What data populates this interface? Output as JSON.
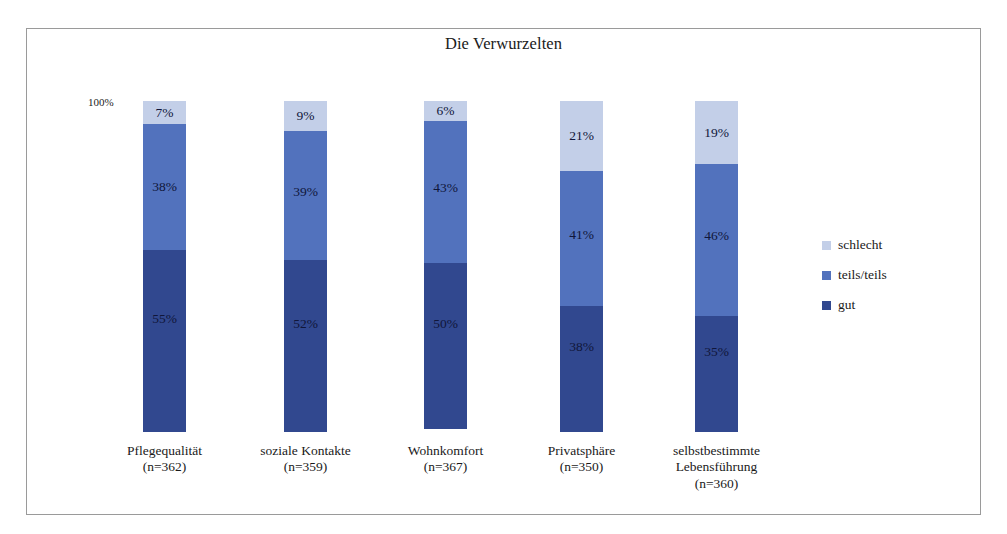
{
  "figure": {
    "title": "Die Verwurzelten",
    "axis_max_label": "100%",
    "scan_remnant": ""
  },
  "chart_data": {
    "type": "bar",
    "subtype": "stacked-100-percent",
    "title": "Die Verwurzelten",
    "xlabel": "",
    "ylabel": "",
    "ylim": [
      0,
      100
    ],
    "grid": false,
    "legend_position": "right",
    "categories": [
      "Pflegequalität",
      "soziale Kontakte",
      "Wohnkomfort",
      "Privatsphäre",
      "selbstbestimmte Lebensführung"
    ],
    "category_sublabels": [
      "(n=362)",
      "(n=359)",
      "(n=367)",
      "(n=350)",
      "(n=360)"
    ],
    "category_sample_sizes": [
      362,
      359,
      367,
      350,
      360
    ],
    "series": [
      {
        "name": "schlecht",
        "color": "#c3cfe8",
        "values": [
          7,
          9,
          6,
          21,
          19
        ],
        "value_labels": [
          "7%",
          "9%",
          "6%",
          "21%",
          "19%"
        ]
      },
      {
        "name": "teils/teils",
        "color": "#5272bd",
        "values": [
          38,
          39,
          43,
          41,
          46
        ],
        "value_labels": [
          "38%",
          "39%",
          "43%",
          "41%",
          "46%"
        ]
      },
      {
        "name": "gut",
        "color": "#31488f",
        "values": [
          55,
          52,
          50,
          38,
          35
        ],
        "value_labels": [
          "55%",
          "52%",
          "50%",
          "38%",
          "35%"
        ]
      }
    ],
    "stack_order_top_to_bottom": [
      "schlecht",
      "teils/teils",
      "gut"
    ]
  },
  "legend": {
    "items": [
      {
        "label": "schlecht",
        "color": "#c3cfe8"
      },
      {
        "label": "teils/teils",
        "color": "#5272bd"
      },
      {
        "label": "gut",
        "color": "#31488f"
      }
    ]
  },
  "colors": {
    "schlecht": "#c3cfe8",
    "teils_teils": "#5272bd",
    "gut": "#31488f",
    "frame": "#9a9a9a",
    "background": "#ffffff",
    "text": "#1a1a1a"
  }
}
